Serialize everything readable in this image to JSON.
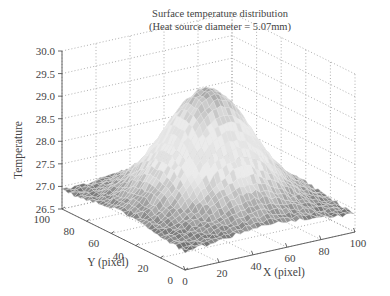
{
  "chart_data": {
    "type": "surface3d",
    "title": "Surface temperature distribution",
    "subtitle": "(Heat source diameter = 5.07mm)",
    "xlabel": "X (pixel)",
    "ylabel": "Y (pixel)",
    "zlabel": "Temperature",
    "x_ticks": [
      "0",
      "20",
      "40",
      "60",
      "80",
      "100"
    ],
    "y_ticks": [
      "0",
      "20",
      "40",
      "60",
      "80",
      "100"
    ],
    "z_ticks": [
      "26.5",
      "27.0",
      "27.5",
      "28.0",
      "28.5",
      "29.0",
      "29.5",
      "30.0"
    ],
    "xlim": [
      0,
      100
    ],
    "ylim": [
      0,
      100
    ],
    "zlim": [
      26.5,
      30.0
    ],
    "grid": true,
    "colormap": "grayscale",
    "surface": {
      "shape": "gaussian-peak",
      "peak_center": [
        50,
        50
      ],
      "peak_value": 29.4,
      "base_value": 26.9,
      "spread_pixels": 22
    }
  }
}
